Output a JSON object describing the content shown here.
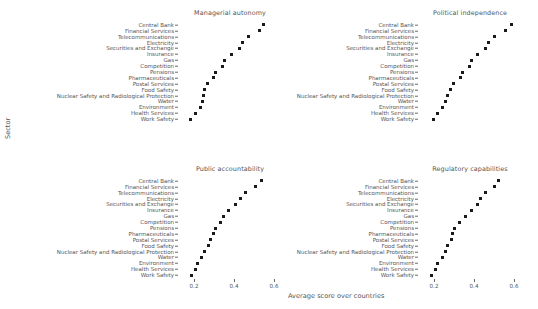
{
  "figure": {
    "xlabel": "Average score over countries",
    "ylabel": "Sector"
  },
  "chart_data": {
    "type": "scatter",
    "title": "",
    "xlabel": "Average score over countries",
    "ylabel": "Sector",
    "xlim": [
      0.12,
      0.64
    ],
    "xticks": [
      0.2,
      0.4,
      0.6
    ],
    "xticklabels": [
      "0.2",
      "0.4",
      "0.6"
    ],
    "grid": false,
    "legend": null,
    "marker": "square",
    "marker_color": "#1a1a1a",
    "categories": [
      "Central Bank",
      "Financial Services",
      "Telecommunications",
      "Electricity",
      "Securities and Exchange",
      "Insurance",
      "Gas",
      "Competition",
      "Pensions",
      "Pharmaceuticals",
      "Postal Services",
      "Food Safety",
      "Nuclear Safety and Radiological Protection",
      "Water",
      "Environment",
      "Health Services",
      "Work Safety"
    ],
    "panels": [
      {
        "title": "Managerial autonomy",
        "row": 0,
        "col": 0,
        "values": [
          0.545,
          0.525,
          0.47,
          0.44,
          0.425,
          0.385,
          0.35,
          0.34,
          0.305,
          0.295,
          0.265,
          0.25,
          0.245,
          0.24,
          0.23,
          0.205,
          0.18
        ]
      },
      {
        "title": "Political independence",
        "row": 0,
        "col": 1,
        "values": [
          0.585,
          0.555,
          0.5,
          0.47,
          0.455,
          0.415,
          0.385,
          0.375,
          0.34,
          0.33,
          0.295,
          0.28,
          0.265,
          0.255,
          0.24,
          0.215,
          0.195
        ]
      },
      {
        "title": "Public accountability",
        "row": 1,
        "col": 0,
        "values": [
          0.535,
          0.505,
          0.455,
          0.43,
          0.405,
          0.37,
          0.345,
          0.33,
          0.305,
          0.295,
          0.28,
          0.27,
          0.25,
          0.235,
          0.215,
          0.205,
          0.185
        ]
      },
      {
        "title": "Regulatory capabilities",
        "row": 1,
        "col": 1,
        "values": [
          0.52,
          0.5,
          0.455,
          0.43,
          0.415,
          0.385,
          0.355,
          0.325,
          0.3,
          0.29,
          0.285,
          0.265,
          0.255,
          0.24,
          0.215,
          0.205,
          0.185
        ]
      }
    ]
  }
}
